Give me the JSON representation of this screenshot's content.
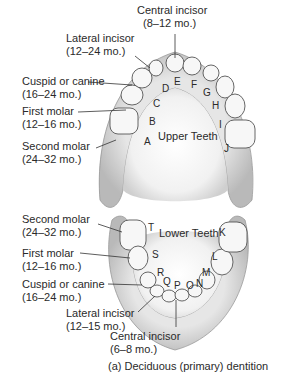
{
  "figure": {
    "caption": "(a) Deciduous (primary) dentition",
    "upper_arch_label": "Upper Teeth",
    "lower_arch_label": "Lower Teeth",
    "upper_labels": [
      {
        "name": "Central incisor",
        "age": "(8–12 mo.)"
      },
      {
        "name": "Lateral incisor",
        "age": "(12–24 mo.)"
      },
      {
        "name": "Cuspid or canine",
        "age": "(16–24 mo.)"
      },
      {
        "name": "First molar",
        "age": "(12–16 mo.)"
      },
      {
        "name": "Second molar",
        "age": "(24–32 mo.)"
      }
    ],
    "lower_labels": [
      {
        "name": "Second molar",
        "age": "(24–32 mo.)"
      },
      {
        "name": "First molar",
        "age": "(12–16 mo.)"
      },
      {
        "name": "Cuspid or canine",
        "age": "(16–24 mo.)"
      },
      {
        "name": "Lateral incisor",
        "age": "(12–15 mo.)"
      },
      {
        "name": "Central incisor",
        "age": "(6–8 mo.)"
      }
    ],
    "upper_letters": [
      "A",
      "B",
      "C",
      "D",
      "E",
      "F",
      "G",
      "H",
      "I",
      "J"
    ],
    "lower_letters": [
      "K",
      "L",
      "M",
      "N",
      "O",
      "P",
      "Q",
      "R",
      "S",
      "T"
    ]
  }
}
